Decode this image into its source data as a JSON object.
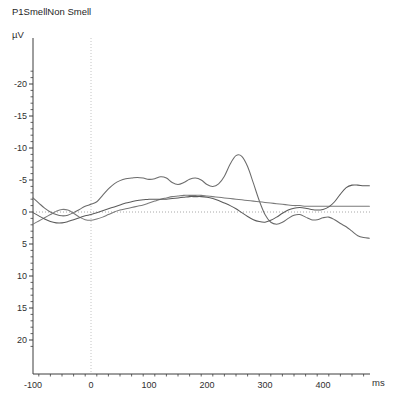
{
  "chart_data": {
    "type": "line",
    "title": "P1SmellNon Smell",
    "xlabel": "ms",
    "ylabel": "µV",
    "xlim": [
      -110,
      480
    ],
    "ylim_display_top": -22.5,
    "ylim_display_bottom": 21.0,
    "y_axis_inverted": true,
    "grid": "zero-lines-only",
    "legend": "none",
    "x_ticks": [
      -100,
      0,
      100,
      200,
      300,
      400
    ],
    "x_tick_labels": [
      "-100",
      "0",
      "100",
      "200",
      "300",
      "400"
    ],
    "x_minor_tick_step": 20,
    "y_ticks": [
      -20,
      -15,
      -10,
      -5,
      0,
      5,
      10,
      15,
      20
    ],
    "y_tick_labels": [
      "-20",
      "-15",
      "-10",
      "-5",
      "0",
      "5",
      "10",
      "15",
      "20"
    ],
    "y_minor_tick_step": 1,
    "zero_line_x": 0,
    "zero_line_y": 0,
    "series": [
      {
        "name": "smell",
        "color": "#6b6b6b",
        "x": [
          -100,
          -90,
          -80,
          -70,
          -60,
          -50,
          -40,
          -30,
          -20,
          -10,
          0,
          10,
          20,
          30,
          40,
          50,
          60,
          70,
          80,
          90,
          100,
          110,
          120,
          130,
          140,
          150,
          160,
          170,
          180,
          190,
          200,
          210,
          220,
          230,
          240,
          250,
          260,
          270,
          280,
          290,
          300,
          310,
          320,
          330,
          340,
          350,
          360,
          370,
          380,
          390,
          400,
          410,
          420,
          430,
          440,
          450,
          460,
          470,
          480
        ],
        "y": [
          -2.2,
          -1.4,
          -0.6,
          0.0,
          0.4,
          0.6,
          0.5,
          0.1,
          -0.4,
          -0.9,
          -1.2,
          -1.6,
          -2.6,
          -3.6,
          -4.4,
          -4.9,
          -5.2,
          -5.3,
          -5.4,
          -5.3,
          -5.1,
          -5.2,
          -5.5,
          -5.3,
          -4.6,
          -4.3,
          -4.6,
          -5.1,
          -5.3,
          -5.0,
          -4.3,
          -4.0,
          -4.4,
          -5.6,
          -7.5,
          -8.8,
          -8.7,
          -7.1,
          -4.5,
          -1.8,
          0.4,
          1.6,
          1.9,
          1.6,
          1.0,
          0.5,
          0.4,
          0.8,
          1.2,
          1.2,
          0.9,
          0.8,
          1.2,
          1.8,
          2.3,
          3.0,
          3.7,
          4.0,
          4.1
        ]
      },
      {
        "name": "non-smell",
        "color": "#7a7a7a",
        "x": [
          -100,
          -90,
          -80,
          -70,
          -60,
          -50,
          -40,
          -30,
          -20,
          -10,
          0,
          10,
          20,
          30,
          40,
          50,
          60,
          70,
          80,
          90,
          100,
          110,
          120,
          130,
          140,
          150,
          160,
          170,
          180,
          190,
          200,
          210,
          220,
          230,
          240,
          250,
          260,
          270,
          280,
          290,
          300,
          310,
          320,
          330,
          340,
          350,
          360,
          370,
          380,
          390,
          400,
          410,
          420,
          430,
          440,
          450,
          460,
          470,
          480
        ],
        "y": [
          1.9,
          1.4,
          0.9,
          0.4,
          -0.1,
          -0.4,
          -0.3,
          0.2,
          0.8,
          1.2,
          1.3,
          1.1,
          0.8,
          0.4,
          0.0,
          -0.3,
          -0.5,
          -0.7,
          -0.9,
          -1.1,
          -1.4,
          -1.7,
          -2.0,
          -2.2,
          -2.4,
          -2.5,
          -2.6,
          -2.6,
          -2.6,
          -2.6,
          -2.5,
          -2.4,
          -2.3,
          -2.2,
          -2.1,
          -2.0,
          -1.9,
          -1.8,
          -1.7,
          -1.6,
          -1.5,
          -1.4,
          -1.3,
          -1.2,
          -1.1,
          -1.0,
          -1.0,
          -0.9,
          -0.9,
          -0.9,
          -0.9,
          -0.9,
          -0.9,
          -0.9,
          -0.9,
          -0.9,
          -0.9,
          -0.9,
          -0.9
        ]
      },
      {
        "name": "difference",
        "color": "#5a5a5a",
        "x": [
          -100,
          -90,
          -80,
          -70,
          -60,
          -50,
          -40,
          -30,
          -20,
          -10,
          0,
          10,
          20,
          30,
          40,
          50,
          60,
          70,
          80,
          90,
          100,
          110,
          120,
          130,
          140,
          150,
          160,
          170,
          180,
          190,
          200,
          210,
          220,
          230,
          240,
          250,
          260,
          270,
          280,
          290,
          300,
          310,
          320,
          330,
          340,
          350,
          360,
          370,
          380,
          390,
          400,
          410,
          420,
          430,
          440,
          450,
          460,
          470,
          480
        ],
        "y": [
          0.1,
          0.6,
          1.1,
          1.5,
          1.7,
          1.7,
          1.5,
          1.2,
          0.9,
          0.6,
          0.4,
          0.1,
          -0.2,
          -0.5,
          -0.8,
          -1.1,
          -1.4,
          -1.6,
          -1.8,
          -1.9,
          -2.0,
          -2.0,
          -2.0,
          -2.0,
          -2.1,
          -2.2,
          -2.3,
          -2.4,
          -2.4,
          -2.4,
          -2.3,
          -2.1,
          -1.8,
          -1.4,
          -1.0,
          -0.5,
          0.1,
          0.7,
          1.2,
          1.5,
          1.6,
          1.3,
          0.8,
          0.2,
          -0.3,
          -0.6,
          -0.7,
          -0.6,
          -0.4,
          -0.3,
          -0.4,
          -0.8,
          -1.6,
          -2.8,
          -3.8,
          -4.2,
          -4.2,
          -4.1,
          -4.1
        ]
      }
    ]
  },
  "axes": {
    "title": "P1SmellNon Smell",
    "y_unit": "µV",
    "x_unit": "ms"
  }
}
